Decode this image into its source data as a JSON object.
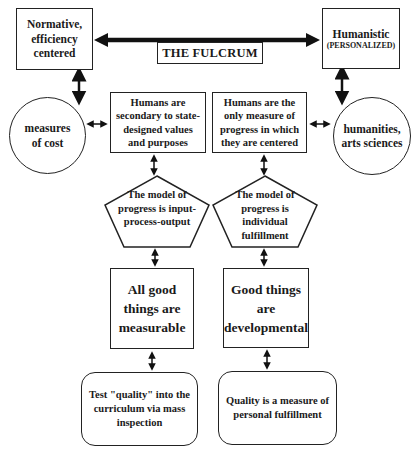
{
  "diagram": {
    "fulcrum_label": "THE FULCRUM",
    "left": {
      "top_box": "Normative, efficiency centered",
      "circle": "measures of cost",
      "context_box": "Humans are secondary to state-designed values and purposes",
      "pentagon": "The model of progress is input-process-output",
      "principle_box": "All good things are measurable",
      "outcome_box": "Test \"quality\" into the curriculum via mass inspection"
    },
    "right": {
      "top_box_title": "Humanistic",
      "top_box_subtitle": "(PERSONALIZED)",
      "circle": "humanities, arts sciences",
      "context_box": "Humans are the only measure of progress in which they are centered",
      "pentagon": "The model of progress is individual fulfillment",
      "principle_box": "Good things are developmental",
      "outcome_box": "Quality is a measure of personal fulfillment"
    },
    "colors": {
      "stroke": "#222222",
      "background": "#ffffff",
      "text": "#1a1a1a"
    }
  }
}
